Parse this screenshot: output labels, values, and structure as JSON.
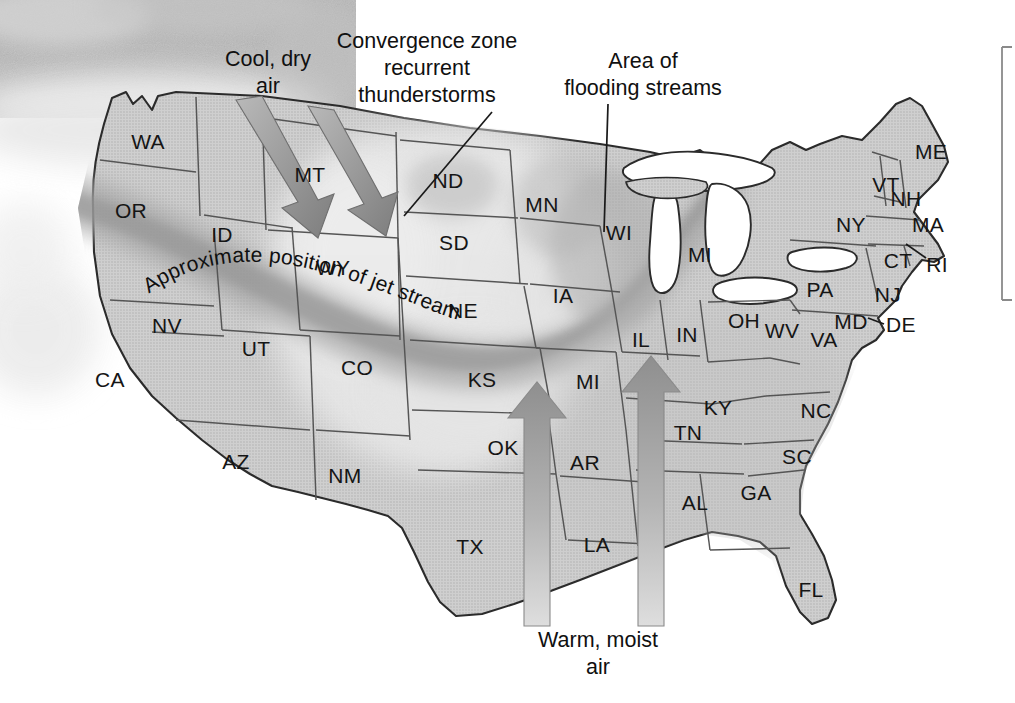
{
  "figure": {
    "background_color": "#ffffff",
    "width": 1015,
    "height": 703
  },
  "colors": {
    "state_fill": "#c9c9c9",
    "state_stroke": "#4a4a4a",
    "outline_stroke": "#222222",
    "water_fill": "#ffffff",
    "jet_band": "#a9a9a9",
    "jet_band_core": "#9a9a9a",
    "convergence_light": "#e3e3e3",
    "arrow_cool": "#8e8e8e",
    "arrow_warm": "#a8a8a8",
    "cloud_photo": "#b4b4b4",
    "text": "#111111",
    "bracket": "#8a8a8a"
  },
  "annotations": [
    {
      "id": "cool-dry-air",
      "lines": [
        "Cool, dry",
        "air"
      ],
      "x": 268,
      "y": 60,
      "line_height": 27
    },
    {
      "id": "convergence-zone",
      "lines": [
        "Convergence zone",
        "recurrent",
        "thunderstorms"
      ],
      "x": 427,
      "y": 42,
      "line_height": 27
    },
    {
      "id": "area-of-flooding-streams",
      "lines": [
        "Area of",
        "flooding streams"
      ],
      "x": 643,
      "y": 62,
      "line_height": 27
    },
    {
      "id": "warm-moist-air",
      "lines": [
        "Warm, moist",
        "air"
      ],
      "x": 598,
      "y": 641,
      "line_height": 27
    }
  ],
  "jet_stream_label": {
    "text": "Approximate position of jet stream",
    "id": "jet-stream-label"
  },
  "arrows": {
    "cool_dry": [
      {
        "id": "cool-dry-arrow-1",
        "label": "northwest cool dry air arrow"
      },
      {
        "id": "cool-dry-arrow-2",
        "label": "northwest cool dry air arrow"
      }
    ],
    "warm_moist": [
      {
        "id": "warm-moist-arrow-1",
        "label": "gulf warm moist air arrow west"
      },
      {
        "id": "warm-moist-arrow-2",
        "label": "gulf warm moist air arrow east"
      }
    ]
  },
  "states": [
    {
      "abbr": "WA",
      "x": 148,
      "y": 143
    },
    {
      "abbr": "OR",
      "x": 131,
      "y": 212
    },
    {
      "abbr": "CA",
      "x": 110,
      "y": 381
    },
    {
      "abbr": "NV",
      "x": 167,
      "y": 327
    },
    {
      "abbr": "ID",
      "x": 222,
      "y": 236
    },
    {
      "abbr": "MT",
      "x": 310,
      "y": 176
    },
    {
      "abbr": "WY",
      "x": 333,
      "y": 269
    },
    {
      "abbr": "UT",
      "x": 256,
      "y": 350
    },
    {
      "abbr": "AZ",
      "x": 236,
      "y": 463
    },
    {
      "abbr": "NM",
      "x": 345,
      "y": 477
    },
    {
      "abbr": "CO",
      "x": 357,
      "y": 369
    },
    {
      "abbr": "ND",
      "x": 448,
      "y": 182
    },
    {
      "abbr": "SD",
      "x": 454,
      "y": 244
    },
    {
      "abbr": "NE",
      "x": 463,
      "y": 312
    },
    {
      "abbr": "KS",
      "x": 482,
      "y": 381
    },
    {
      "abbr": "OK",
      "x": 503,
      "y": 449
    },
    {
      "abbr": "TX",
      "x": 470,
      "y": 548
    },
    {
      "abbr": "MN",
      "x": 542,
      "y": 206
    },
    {
      "abbr": "IA",
      "x": 563,
      "y": 297
    },
    {
      "abbr": "MI",
      "x": 588,
      "y": 383
    },
    {
      "abbr": "AR",
      "x": 585,
      "y": 464
    },
    {
      "abbr": "LA",
      "x": 597,
      "y": 546
    },
    {
      "abbr": "WI",
      "x": 619,
      "y": 234
    },
    {
      "abbr": "IL",
      "x": 641,
      "y": 341
    },
    {
      "abbr": "IN",
      "x": 687,
      "y": 336
    },
    {
      "abbr": "MI",
      "x": 700,
      "y": 256
    },
    {
      "abbr": "OH",
      "x": 744,
      "y": 322
    },
    {
      "abbr": "KY",
      "x": 718,
      "y": 409
    },
    {
      "abbr": "TN",
      "x": 688,
      "y": 434
    },
    {
      "abbr": "AL",
      "x": 695,
      "y": 504
    },
    {
      "abbr": "GA",
      "x": 756,
      "y": 494
    },
    {
      "abbr": "FL",
      "x": 811,
      "y": 591
    },
    {
      "abbr": "SC",
      "x": 797,
      "y": 458
    },
    {
      "abbr": "NC",
      "x": 816,
      "y": 412
    },
    {
      "abbr": "VA",
      "x": 824,
      "y": 341
    },
    {
      "abbr": "WV",
      "x": 782,
      "y": 332
    },
    {
      "abbr": "PA",
      "x": 820,
      "y": 291
    },
    {
      "abbr": "MD",
      "x": 851,
      "y": 323
    },
    {
      "abbr": "DE",
      "x": 901,
      "y": 326
    },
    {
      "abbr": "NJ",
      "x": 888,
      "y": 296
    },
    {
      "abbr": "NY",
      "x": 851,
      "y": 226
    },
    {
      "abbr": "CT",
      "x": 898,
      "y": 262
    },
    {
      "abbr": "RI",
      "x": 937,
      "y": 266
    },
    {
      "abbr": "MA",
      "x": 928,
      "y": 226
    },
    {
      "abbr": "NH",
      "x": 906,
      "y": 200
    },
    {
      "abbr": "VT",
      "x": 886,
      "y": 186
    },
    {
      "abbr": "ME",
      "x": 931,
      "y": 153
    }
  ]
}
